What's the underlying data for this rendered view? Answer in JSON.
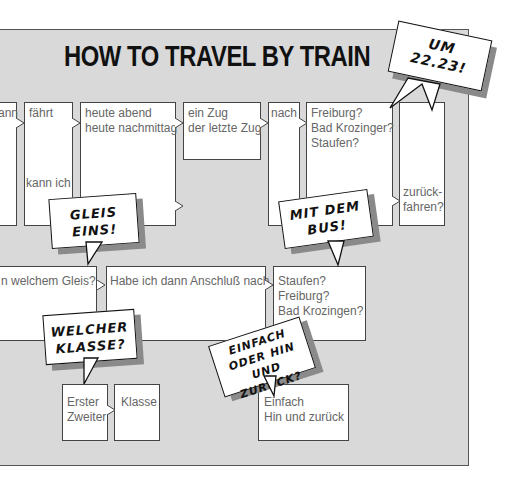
{
  "title": "HOW TO TRAVEL BY TRAIN",
  "colors": {
    "panel": "#d9d9d9",
    "box": "#ffffff",
    "border": "#444444",
    "text": "#666666",
    "bubble_shadow": "#8a8a8a"
  },
  "row1": {
    "col0": {
      "lines": [
        "Wann"
      ],
      "visible_text": "ann"
    },
    "col1": {
      "lines": [
        "fährt",
        "",
        "",
        "",
        "",
        "",
        "kann ich"
      ]
    },
    "col2": {
      "lines": [
        "heute abend",
        "heute nachmittag"
      ]
    },
    "col3": {
      "lines": [
        "ein Zug",
        "der letzte Zug"
      ]
    },
    "col4": {
      "lines": [
        "nach"
      ]
    },
    "col5": {
      "lines": [
        "Freiburg?",
        "Bad Krozinger?",
        "Staufen?"
      ]
    },
    "col6": {
      "lines": [
        "zurück-",
        "fahren?"
      ]
    }
  },
  "row2": {
    "col0": {
      "lines": [
        "n welchem Gleis?"
      ]
    },
    "col1": {
      "lines": [
        "Habe ich dann Anschluß nach"
      ]
    },
    "col2": {
      "lines": [
        "Staufen?",
        "Freiburg?",
        "Bad Krozingen?"
      ]
    }
  },
  "row3": {
    "col0": {
      "lines": [
        "Erster",
        "Zweiter"
      ]
    },
    "col1": {
      "lines": [
        "Klasse"
      ]
    },
    "col2": {
      "lines": [
        "Einfach",
        "Hin und zurück"
      ]
    }
  },
  "bubbles": {
    "time": {
      "lines": [
        "UM",
        "22.23!"
      ]
    },
    "platform": {
      "lines": [
        "GLEIS",
        "EINS!"
      ]
    },
    "bus": {
      "lines": [
        "MIT DEM",
        "BUS!"
      ]
    },
    "class": {
      "lines": [
        "WELCHER",
        "KLASSE?"
      ]
    },
    "ticket": {
      "lines": [
        "EINFACH",
        "ODER HIN",
        "UND ZURÜCK?"
      ]
    }
  }
}
